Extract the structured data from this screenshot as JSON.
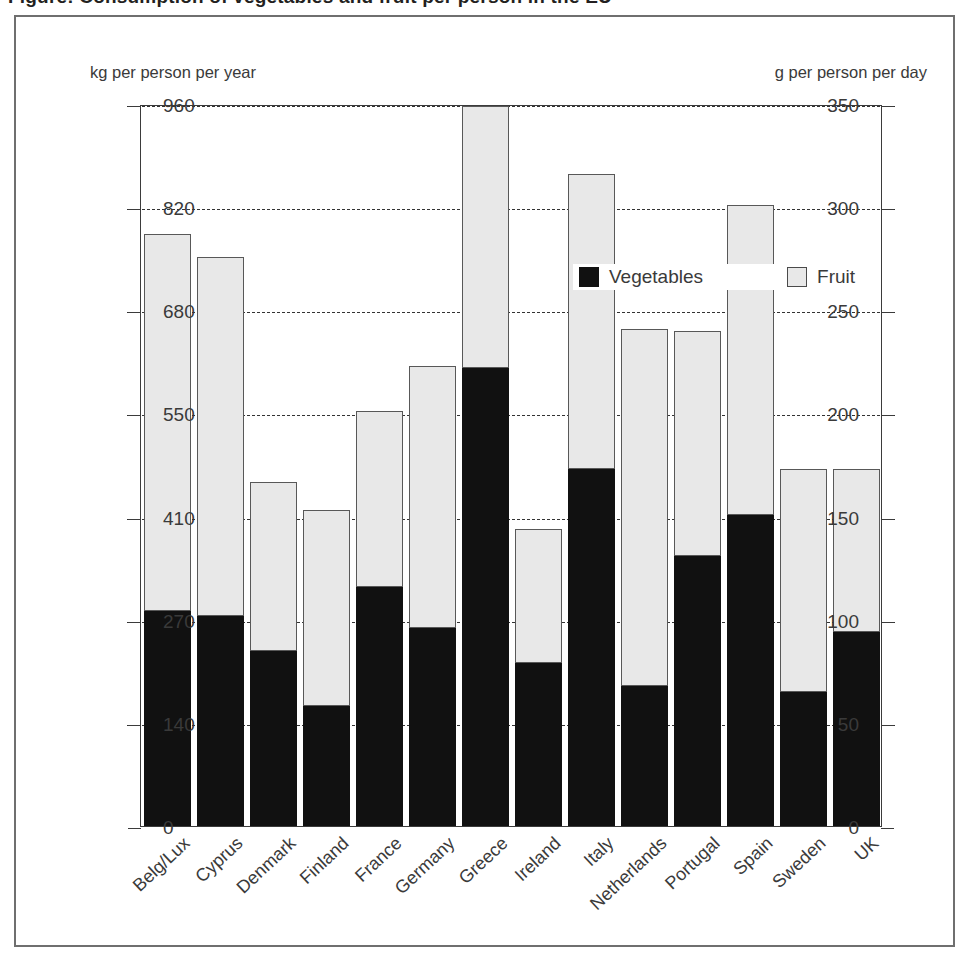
{
  "title": "Figure: Consumption of vegetables and fruit per person in the EU",
  "units": {
    "left": "kg per person per year",
    "right": "g per person per day"
  },
  "legend": {
    "position": "top-center",
    "items": [
      {
        "label": "Vegetables",
        "color": "#111111",
        "key": "vegetables"
      },
      {
        "label": "Fruit",
        "color": "#e8e8e8",
        "key": "fruit"
      }
    ]
  },
  "axes": {
    "left": {
      "label": "kg per person per year",
      "ticks": [
        0,
        50,
        100,
        150,
        200,
        250,
        300,
        350
      ],
      "min": 0,
      "max": 350
    },
    "right": {
      "label": "g per person per day",
      "ticks": [
        0,
        140,
        270,
        410,
        550,
        680,
        820,
        960
      ],
      "min": 0,
      "max": 960
    },
    "grid": "dashed-horizontal"
  },
  "chart_data": {
    "type": "bar",
    "stacked": true,
    "title": "Consumption of vegetables and fruit per person in the EU",
    "xlabel": "",
    "ylabel": "kg per person per year",
    "ylabel_secondary": "g per person per day",
    "ylim": [
      0,
      350
    ],
    "ylim_secondary": [
      0,
      960
    ],
    "yticks": [
      0,
      50,
      100,
      150,
      200,
      250,
      300,
      350
    ],
    "yticks_secondary": [
      0,
      140,
      270,
      410,
      550,
      680,
      820,
      960
    ],
    "grid": true,
    "legend_position": "top-center",
    "categories": [
      "Belg/Lux",
      "Cyprus",
      "Denmark",
      "Finland",
      "France",
      "Germany",
      "Greece",
      "Ireland",
      "Italy",
      "Netherlands",
      "Portugal",
      "Spain",
      "Sweden",
      "UK"
    ],
    "series": [
      {
        "name": "Vegetables",
        "color": "#111111",
        "values": [
          104,
          102,
          85,
          58,
          116,
          96,
          222,
          79,
          173,
          68,
          131,
          151,
          65,
          94
        ]
      },
      {
        "name": "Fruit",
        "color": "#e8e8e8",
        "values": [
          183,
          174,
          82,
          95,
          85,
          127,
          127,
          65,
          143,
          173,
          109,
          150,
          108,
          79
        ]
      }
    ],
    "totals": [
      287,
      276,
      167,
      153,
      201,
      223,
      349,
      144,
      316,
      241,
      240,
      301,
      173,
      173
    ]
  },
  "colors": {
    "vegetables": "#111111",
    "fruit": "#e8e8e8",
    "axis": "#3b3b3b",
    "frame": "#6f6f6f",
    "text": "#3a3a3a",
    "background": "#ffffff"
  }
}
